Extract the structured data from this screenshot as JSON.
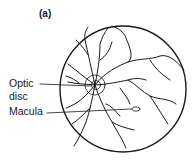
{
  "figure": {
    "panel_label": "(a)",
    "labels": {
      "optic_disc_line1": "Optic",
      "optic_disc_line2": "disc",
      "macula": "Macula"
    },
    "colors": {
      "ink": "#1a1a1a",
      "background": "#ffffff"
    }
  }
}
